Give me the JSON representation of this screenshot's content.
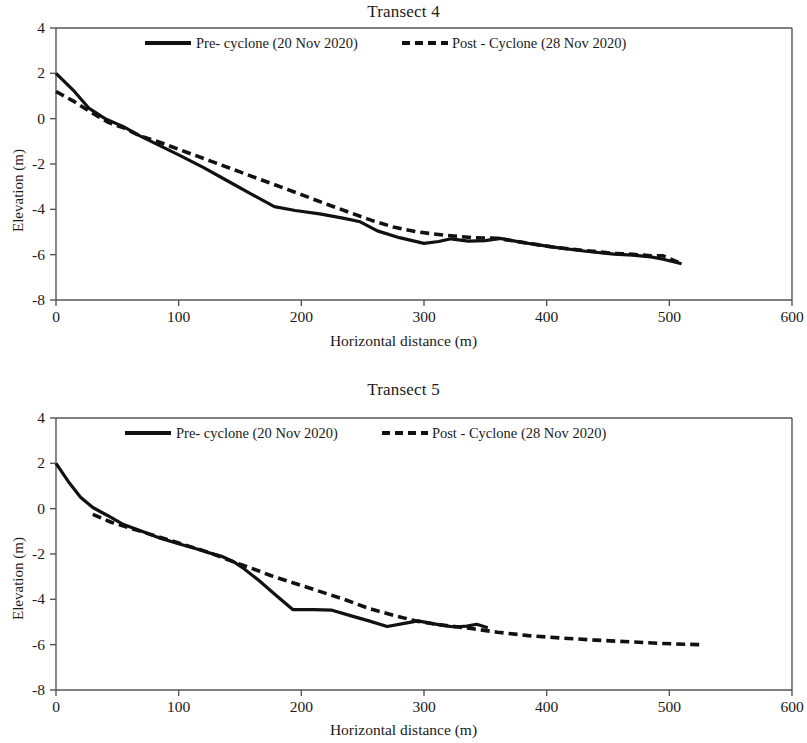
{
  "figures": [
    {
      "id": "transect4",
      "title": "Transect 4",
      "xlabel": "Horizontal distance (m)",
      "ylabel": "Elevation (m)",
      "legend": {
        "pre_label": "Pre- cyclone (20 Nov 2020)",
        "post_label": "Post - Cyclone (28 Nov 2020)"
      },
      "xticks": [
        "0",
        "100",
        "200",
        "300",
        "400",
        "500",
        "600"
      ],
      "yticks": [
        "4",
        "2",
        "0",
        "-2",
        "-4",
        "-6",
        "-8"
      ]
    },
    {
      "id": "transect5",
      "title": "Transect 5",
      "xlabel": "Horizontal distance (m)",
      "ylabel": "Elevation (m)",
      "legend": {
        "pre_label": "Pre- cyclone (20 Nov 2020)",
        "post_label": "Post - Cyclone (28 Nov 2020)"
      },
      "xticks": [
        "0",
        "100",
        "200",
        "300",
        "400",
        "500",
        "600"
      ],
      "yticks": [
        "4",
        "2",
        "0",
        "-2",
        "-4",
        "-6",
        "-8"
      ]
    }
  ],
  "colors": {
    "line": "#111111",
    "axis": "#555555",
    "background": "#ffffff"
  },
  "chart_data": [
    {
      "type": "line",
      "title": "Transect 4",
      "xlabel": "Horizontal distance (m)",
      "ylabel": "Elevation (m)",
      "xlim": [
        0,
        600
      ],
      "ylim": [
        -8,
        4
      ],
      "xticks": [
        0,
        100,
        200,
        300,
        400,
        500,
        600
      ],
      "yticks": [
        4,
        2,
        0,
        -2,
        -4,
        -6,
        -8
      ],
      "grid": false,
      "legend_position": "top-inside",
      "series": [
        {
          "name": "Pre- cyclone (20 Nov 2020)",
          "style": "solid",
          "points": [
            [
              0,
              2.0
            ],
            [
              15,
              1.2
            ],
            [
              27,
              0.45
            ],
            [
              40,
              0.0
            ],
            [
              55,
              -0.35
            ],
            [
              68,
              -0.75
            ],
            [
              85,
              -1.2
            ],
            [
              100,
              -1.6
            ],
            [
              120,
              -2.15
            ],
            [
              140,
              -2.75
            ],
            [
              160,
              -3.35
            ],
            [
              178,
              -3.88
            ],
            [
              195,
              -4.05
            ],
            [
              215,
              -4.2
            ],
            [
              235,
              -4.4
            ],
            [
              248,
              -4.55
            ],
            [
              262,
              -4.95
            ],
            [
              280,
              -5.25
            ],
            [
              300,
              -5.5
            ],
            [
              312,
              -5.42
            ],
            [
              322,
              -5.3
            ],
            [
              336,
              -5.4
            ],
            [
              350,
              -5.38
            ],
            [
              362,
              -5.28
            ],
            [
              385,
              -5.5
            ],
            [
              410,
              -5.7
            ],
            [
              432,
              -5.85
            ],
            [
              455,
              -5.98
            ],
            [
              470,
              -6.02
            ],
            [
              485,
              -6.1
            ],
            [
              495,
              -6.2
            ],
            [
              510,
              -6.4
            ]
          ]
        },
        {
          "name": "Post - Cyclone (28 Nov 2020)",
          "style": "dashed",
          "points": [
            [
              0,
              1.2
            ],
            [
              15,
              0.75
            ],
            [
              28,
              0.3
            ],
            [
              42,
              -0.15
            ],
            [
              55,
              -0.4
            ],
            [
              68,
              -0.75
            ],
            [
              85,
              -1.05
            ],
            [
              100,
              -1.35
            ],
            [
              125,
              -1.85
            ],
            [
              150,
              -2.35
            ],
            [
              175,
              -2.85
            ],
            [
              200,
              -3.35
            ],
            [
              222,
              -3.8
            ],
            [
              240,
              -4.15
            ],
            [
              258,
              -4.5
            ],
            [
              275,
              -4.78
            ],
            [
              295,
              -5.0
            ],
            [
              318,
              -5.15
            ],
            [
              340,
              -5.25
            ],
            [
              360,
              -5.28
            ],
            [
              385,
              -5.5
            ],
            [
              410,
              -5.7
            ],
            [
              432,
              -5.82
            ],
            [
              455,
              -5.95
            ],
            [
              470,
              -5.98
            ],
            [
              485,
              -6.05
            ],
            [
              495,
              -6.05
            ],
            [
              508,
              -6.35
            ]
          ]
        }
      ]
    },
    {
      "type": "line",
      "title": "Transect 5",
      "xlabel": "Horizontal distance (m)",
      "ylabel": "Elevation (m)",
      "xlim": [
        0,
        600
      ],
      "ylim": [
        -8,
        4
      ],
      "xticks": [
        0,
        100,
        200,
        300,
        400,
        500,
        600
      ],
      "yticks": [
        4,
        2,
        0,
        -2,
        -4,
        -6,
        -8
      ],
      "grid": false,
      "legend_position": "top-inside",
      "series": [
        {
          "name": "Pre- cyclone (20 Nov 2020)",
          "style": "solid",
          "points": [
            [
              0,
              2.0
            ],
            [
              10,
              1.2
            ],
            [
              20,
              0.5
            ],
            [
              30,
              0.05
            ],
            [
              42,
              -0.3
            ],
            [
              55,
              -0.7
            ],
            [
              70,
              -1.0
            ],
            [
              85,
              -1.3
            ],
            [
              100,
              -1.55
            ],
            [
              115,
              -1.78
            ],
            [
              125,
              -1.95
            ],
            [
              135,
              -2.1
            ],
            [
              145,
              -2.35
            ],
            [
              152,
              -2.6
            ],
            [
              165,
              -3.15
            ],
            [
              180,
              -3.85
            ],
            [
              193,
              -4.45
            ],
            [
              210,
              -4.45
            ],
            [
              225,
              -4.48
            ],
            [
              240,
              -4.72
            ],
            [
              255,
              -4.95
            ],
            [
              270,
              -5.2
            ],
            [
              285,
              -5.05
            ],
            [
              295,
              -4.95
            ],
            [
              305,
              -5.05
            ],
            [
              315,
              -5.15
            ],
            [
              325,
              -5.22
            ],
            [
              335,
              -5.18
            ],
            [
              343,
              -5.1
            ],
            [
              352,
              -5.25
            ]
          ]
        },
        {
          "name": "Post - Cyclone (28 Nov 2020)",
          "style": "dashed",
          "points": [
            [
              30,
              -0.25
            ],
            [
              45,
              -0.6
            ],
            [
              60,
              -0.85
            ],
            [
              75,
              -1.1
            ],
            [
              90,
              -1.35
            ],
            [
              105,
              -1.6
            ],
            [
              120,
              -1.85
            ],
            [
              133,
              -2.1
            ],
            [
              145,
              -2.35
            ],
            [
              158,
              -2.6
            ],
            [
              175,
              -2.95
            ],
            [
              195,
              -3.3
            ],
            [
              215,
              -3.65
            ],
            [
              235,
              -4.0
            ],
            [
              255,
              -4.4
            ],
            [
              275,
              -4.7
            ],
            [
              293,
              -4.95
            ],
            [
              310,
              -5.1
            ],
            [
              325,
              -5.2
            ],
            [
              340,
              -5.3
            ],
            [
              360,
              -5.45
            ],
            [
              385,
              -5.6
            ],
            [
              410,
              -5.7
            ],
            [
              440,
              -5.8
            ],
            [
              470,
              -5.88
            ],
            [
              495,
              -5.95
            ],
            [
              525,
              -6.0
            ]
          ]
        }
      ]
    }
  ]
}
